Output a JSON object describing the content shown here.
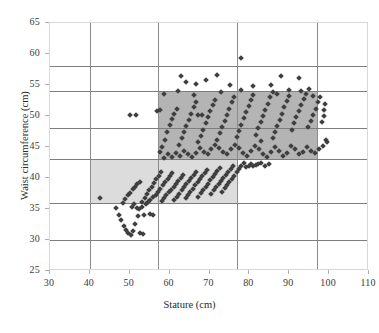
{
  "chart_data": {
    "type": "scatter",
    "title": "",
    "xlabel": "Stature (cm)",
    "ylabel": "Waist circumference (cm)",
    "xlim": [
      30,
      110
    ],
    "ylim": [
      25,
      65
    ],
    "xticks": [
      30,
      40,
      50,
      60,
      70,
      80,
      90,
      100,
      110
    ],
    "yticks": [
      25,
      30,
      35,
      40,
      45,
      50,
      55,
      60,
      65
    ],
    "grid": true,
    "gridlines": {
      "vertical": [
        40,
        57,
        77,
        97
      ],
      "horizontal": [
        30,
        36,
        43,
        48,
        54,
        58
      ]
    },
    "legend": null,
    "annotations": [
      {
        "name": "lower-reference-band",
        "type": "rect",
        "x_range": [
          40,
          77
        ],
        "y_range": [
          36,
          43
        ],
        "color": "#dcdcdc"
      },
      {
        "name": "upper-reference-band",
        "type": "rect",
        "x_range": [
          57,
          97
        ],
        "y_range": [
          43,
          54
        ],
        "color": "#b4b4b4"
      }
    ],
    "series": [
      {
        "name": "children",
        "marker": "diamond",
        "color": "#3f3f3f",
        "points": [
          [
            42.5,
            36.8
          ],
          [
            46.5,
            35.2
          ],
          [
            47.2,
            34.1
          ],
          [
            47.8,
            33.2
          ],
          [
            48.5,
            32.2
          ],
          [
            49.0,
            31.6
          ],
          [
            49.6,
            31.2
          ],
          [
            50.2,
            30.8
          ],
          [
            50.8,
            31.4
          ],
          [
            51.4,
            32.6
          ],
          [
            52.0,
            33.8
          ],
          [
            52.6,
            31.1
          ],
          [
            53.2,
            30.9
          ],
          [
            48.2,
            36.0
          ],
          [
            48.9,
            36.6
          ],
          [
            49.5,
            37.2
          ],
          [
            50.1,
            37.6
          ],
          [
            50.7,
            38.2
          ],
          [
            51.3,
            38.6
          ],
          [
            51.9,
            39.1
          ],
          [
            52.5,
            39.4
          ],
          [
            53.1,
            36.2
          ],
          [
            53.7,
            36.8
          ],
          [
            54.3,
            37.4
          ],
          [
            54.9,
            38.0
          ],
          [
            55.5,
            38.6
          ],
          [
            56.1,
            39.2
          ],
          [
            56.7,
            39.8
          ],
          [
            57.3,
            40.4
          ],
          [
            57.9,
            41.0
          ],
          [
            53.5,
            34.0
          ],
          [
            55.0,
            34.2
          ],
          [
            55.8,
            34.1
          ],
          [
            52.2,
            35.0
          ],
          [
            53.0,
            35.4
          ],
          [
            54.0,
            35.8
          ],
          [
            54.6,
            36.2
          ],
          [
            50.5,
            35.4
          ],
          [
            51.1,
            35.8
          ],
          [
            51.7,
            35.2
          ],
          [
            55.2,
            36.4
          ],
          [
            55.9,
            36.9
          ],
          [
            56.5,
            37.3
          ],
          [
            57.1,
            37.8
          ],
          [
            57.7,
            38.3
          ],
          [
            58.3,
            38.8
          ],
          [
            58.9,
            39.3
          ],
          [
            59.5,
            39.8
          ],
          [
            60.1,
            40.3
          ],
          [
            60.7,
            40.8
          ],
          [
            58.0,
            36.3
          ],
          [
            58.6,
            36.8
          ],
          [
            59.2,
            37.2
          ],
          [
            59.8,
            37.7
          ],
          [
            60.4,
            38.1
          ],
          [
            61.0,
            38.6
          ],
          [
            61.6,
            39.0
          ],
          [
            62.2,
            39.5
          ],
          [
            62.8,
            40.0
          ],
          [
            63.4,
            40.5
          ],
          [
            61.2,
            36.5
          ],
          [
            61.8,
            37.0
          ],
          [
            62.4,
            37.5
          ],
          [
            63.0,
            38.0
          ],
          [
            63.6,
            38.5
          ],
          [
            64.2,
            39.0
          ],
          [
            64.8,
            39.5
          ],
          [
            65.4,
            40.0
          ],
          [
            66.0,
            40.5
          ],
          [
            66.6,
            41.0
          ],
          [
            64.0,
            36.8
          ],
          [
            64.6,
            37.3
          ],
          [
            65.2,
            37.8
          ],
          [
            65.8,
            38.3
          ],
          [
            66.4,
            38.8
          ],
          [
            67.0,
            39.3
          ],
          [
            67.6,
            39.8
          ],
          [
            68.2,
            40.3
          ],
          [
            68.8,
            40.8
          ],
          [
            69.4,
            41.3
          ],
          [
            67.2,
            37.0
          ],
          [
            67.8,
            37.6
          ],
          [
            68.4,
            38.1
          ],
          [
            69.0,
            38.6
          ],
          [
            69.6,
            39.1
          ],
          [
            70.2,
            39.6
          ],
          [
            70.8,
            40.1
          ],
          [
            71.4,
            40.6
          ],
          [
            72.0,
            41.1
          ],
          [
            72.6,
            41.6
          ],
          [
            70.5,
            37.4
          ],
          [
            71.1,
            38.0
          ],
          [
            71.7,
            38.5
          ],
          [
            72.3,
            39.0
          ],
          [
            72.9,
            39.5
          ],
          [
            73.5,
            40.0
          ],
          [
            74.1,
            40.5
          ],
          [
            74.7,
            41.0
          ],
          [
            75.3,
            41.5
          ],
          [
            75.9,
            42.0
          ],
          [
            73.2,
            37.8
          ],
          [
            73.8,
            38.4
          ],
          [
            74.4,
            38.9
          ],
          [
            75.0,
            39.4
          ],
          [
            75.6,
            39.9
          ],
          [
            76.2,
            40.4
          ],
          [
            76.8,
            40.9
          ],
          [
            77.4,
            41.4
          ],
          [
            78.0,
            41.9
          ],
          [
            78.6,
            42.4
          ],
          [
            79.2,
            41.8
          ],
          [
            79.8,
            42.0
          ],
          [
            80.4,
            42.2
          ],
          [
            81.0,
            41.9
          ],
          [
            81.6,
            42.1
          ],
          [
            82.2,
            42.3
          ],
          [
            83.0,
            42.5
          ],
          [
            84.0,
            42.0
          ],
          [
            85.0,
            42.2
          ],
          [
            57.5,
            44.2
          ],
          [
            58.2,
            45.0
          ],
          [
            58.8,
            46.2
          ],
          [
            59.4,
            47.4
          ],
          [
            60.0,
            48.6
          ],
          [
            60.6,
            49.5
          ],
          [
            61.2,
            50.4
          ],
          [
            61.8,
            51.2
          ],
          [
            62.4,
            45.4
          ],
          [
            63.0,
            46.4
          ],
          [
            63.6,
            47.4
          ],
          [
            64.2,
            48.4
          ],
          [
            64.8,
            49.4
          ],
          [
            65.4,
            50.4
          ],
          [
            66.0,
            51.4
          ],
          [
            66.6,
            52.2
          ],
          [
            67.2,
            45.8
          ],
          [
            67.8,
            46.8
          ],
          [
            68.4,
            47.8
          ],
          [
            69.0,
            48.8
          ],
          [
            69.6,
            49.8
          ],
          [
            70.2,
            50.8
          ],
          [
            70.8,
            51.8
          ],
          [
            71.4,
            52.6
          ],
          [
            72.0,
            46.2
          ],
          [
            72.6,
            47.2
          ],
          [
            73.2,
            48.2
          ],
          [
            73.8,
            49.2
          ],
          [
            74.4,
            50.2
          ],
          [
            75.0,
            51.2
          ],
          [
            75.6,
            52.2
          ],
          [
            76.2,
            53.0
          ],
          [
            76.8,
            46.6
          ],
          [
            77.4,
            47.6
          ],
          [
            78.0,
            48.6
          ],
          [
            78.6,
            49.6
          ],
          [
            79.2,
            50.6
          ],
          [
            79.8,
            51.6
          ],
          [
            80.4,
            52.6
          ],
          [
            81.0,
            53.4
          ],
          [
            81.6,
            47.0
          ],
          [
            82.2,
            48.0
          ],
          [
            82.8,
            49.0
          ],
          [
            83.4,
            50.0
          ],
          [
            84.0,
            51.0
          ],
          [
            84.6,
            52.0
          ],
          [
            85.2,
            53.0
          ],
          [
            85.8,
            53.8
          ],
          [
            86.4,
            47.4
          ],
          [
            87.0,
            48.4
          ],
          [
            87.6,
            49.4
          ],
          [
            88.2,
            50.4
          ],
          [
            88.8,
            51.4
          ],
          [
            89.4,
            52.4
          ],
          [
            90.0,
            53.2
          ],
          [
            90.6,
            47.8
          ],
          [
            91.2,
            48.8
          ],
          [
            91.8,
            49.8
          ],
          [
            92.4,
            50.8
          ],
          [
            93.0,
            51.8
          ],
          [
            93.6,
            52.8
          ],
          [
            94.2,
            53.5
          ],
          [
            94.8,
            48.2
          ],
          [
            95.4,
            49.2
          ],
          [
            96.0,
            50.2
          ],
          [
            96.6,
            51.2
          ],
          [
            97.2,
            52.2
          ],
          [
            97.8,
            53.0
          ],
          [
            98.2,
            49.0
          ],
          [
            98.6,
            50.0
          ],
          [
            98.8,
            51.0
          ],
          [
            99.0,
            52.0
          ],
          [
            99.2,
            46.2
          ],
          [
            98.5,
            45.2
          ],
          [
            97.5,
            44.6
          ],
          [
            96.5,
            44.0
          ],
          [
            95.5,
            44.4
          ],
          [
            94.5,
            45.0
          ],
          [
            93.5,
            44.2
          ],
          [
            92.5,
            43.8
          ],
          [
            91.5,
            44.6
          ],
          [
            90.5,
            45.2
          ],
          [
            89.5,
            44.0
          ],
          [
            88.5,
            43.6
          ],
          [
            87.5,
            44.4
          ],
          [
            86.5,
            45.0
          ],
          [
            85.5,
            44.2
          ],
          [
            84.5,
            43.4
          ],
          [
            83.5,
            43.8
          ],
          [
            82.5,
            44.6
          ],
          [
            81.5,
            45.2
          ],
          [
            80.5,
            44.4
          ],
          [
            79.5,
            43.6
          ],
          [
            78.5,
            44.0
          ],
          [
            77.5,
            44.8
          ],
          [
            76.5,
            45.4
          ],
          [
            75.5,
            44.6
          ],
          [
            74.5,
            43.8
          ],
          [
            73.5,
            44.2
          ],
          [
            72.5,
            44.8
          ],
          [
            71.5,
            45.4
          ],
          [
            70.5,
            44.6
          ],
          [
            69.5,
            43.8
          ],
          [
            68.5,
            44.2
          ],
          [
            67.5,
            44.8
          ],
          [
            66.5,
            44.0
          ],
          [
            65.5,
            43.4
          ],
          [
            64.5,
            43.8
          ],
          [
            63.5,
            44.4
          ],
          [
            62.5,
            43.6
          ],
          [
            61.5,
            44.0
          ],
          [
            60.5,
            43.4
          ],
          [
            59.5,
            43.8
          ],
          [
            58.5,
            43.2
          ],
          [
            77.8,
            59.3
          ],
          [
            62.8,
            56.4
          ],
          [
            64.0,
            55.5
          ],
          [
            66.5,
            55.2
          ],
          [
            69.0,
            55.8
          ],
          [
            71.8,
            56.6
          ],
          [
            75.2,
            55.0
          ],
          [
            88.0,
            56.4
          ],
          [
            92.5,
            56.2
          ],
          [
            81.0,
            54.8
          ],
          [
            85.5,
            55.0
          ],
          [
            95.0,
            54.4
          ],
          [
            50.0,
            50.2
          ],
          [
            51.5,
            50.2
          ],
          [
            56.8,
            50.8
          ],
          [
            57.6,
            51.0
          ],
          [
            67.0,
            50.2
          ],
          [
            68.0,
            50.2
          ],
          [
            83.0,
            46.0
          ],
          [
            86.0,
            46.4
          ],
          [
            99.5,
            45.8
          ],
          [
            78.0,
            54.2
          ],
          [
            90.0,
            54.2
          ],
          [
            93.0,
            54.0
          ],
          [
            62.0,
            54.1
          ],
          [
            58.5,
            53.6
          ],
          [
            66.0,
            53.4
          ],
          [
            73.0,
            53.8
          ],
          [
            87.0,
            53.6
          ],
          [
            96.0,
            53.2
          ]
        ]
      }
    ]
  }
}
